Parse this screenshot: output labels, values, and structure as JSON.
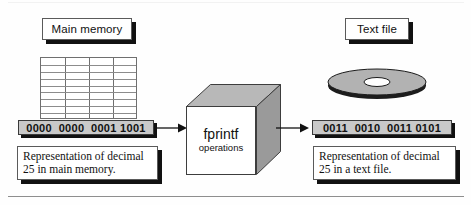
{
  "figure": {
    "title_left": "Main memory",
    "title_right": "Text file",
    "process_label": "fprintf",
    "process_sublabel": "operations",
    "memory_binary": "0000  0000  0001 1001",
    "file_binary": "0011  0010  0011 0101",
    "memory_caption": "Representation of decimal 25 in main memory.",
    "file_caption": "Representation of decimal 25 in a text file.",
    "grid": {
      "columns": 4,
      "rows": 9
    },
    "colors": {
      "binary_bar_fill": "#c9c9c9",
      "shadow": "#111111",
      "cube_top": "#b8b8b8",
      "cube_side": "#9a9a9a",
      "cube_front": "#ffffff",
      "disc_top": "#b2b2b2",
      "disc_edge": "#1c1c1c",
      "grid_line": "#6f6f6f",
      "rule": "#8e8e8e"
    },
    "icons": {
      "grid": "memory-grid-icon",
      "disc": "disc-platter-icon",
      "cube": "process-cube-icon",
      "arrow_in": "arrow-right-icon",
      "arrow_out": "arrow-right-icon"
    }
  }
}
